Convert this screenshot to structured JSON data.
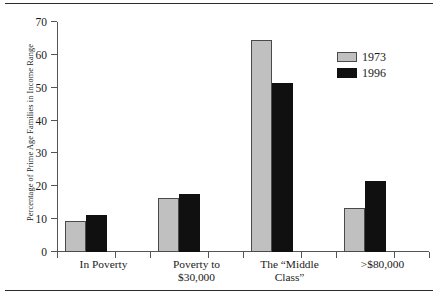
{
  "chart_data": {
    "type": "bar",
    "title": "",
    "xlabel": "",
    "ylabel": "Percentage of Prime Age Families in Income Range",
    "ylim": [
      0,
      70
    ],
    "yticks": [
      0,
      10,
      20,
      30,
      40,
      50,
      60,
      70
    ],
    "grid": false,
    "legend_position": "upper right",
    "categories": [
      "In Poverty",
      "Poverty to\n$30,000",
      "The “Middle\nClass”",
      ">$80,000"
    ],
    "series": [
      {
        "name": "1973",
        "color": "#c0c0c0",
        "values": [
          9.3,
          16.5,
          64.5,
          13.5
        ]
      },
      {
        "name": "1996",
        "color": "#101010",
        "values": [
          11.3,
          17.8,
          51.5,
          21.5
        ]
      }
    ]
  }
}
